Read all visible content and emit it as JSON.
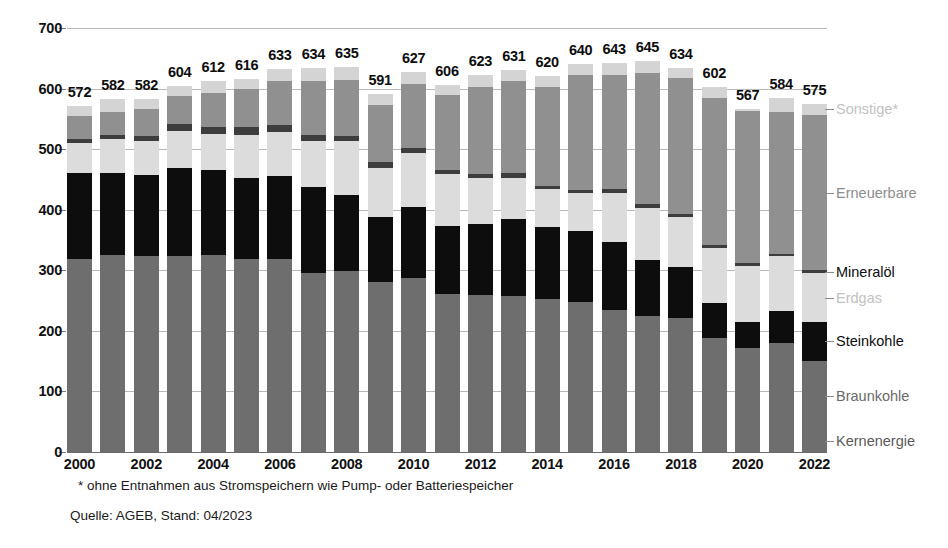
{
  "chart_data": {
    "type": "bar",
    "stacked": true,
    "title": "",
    "subtitle": "",
    "xlabel": "",
    "ylabel": "",
    "ylim": [
      0,
      700
    ],
    "ytick_step": 100,
    "yticks": [
      "0",
      "100",
      "200",
      "300",
      "400",
      "500",
      "600",
      "700"
    ],
    "grid": true,
    "legend_position": "right",
    "categories": [
      "2000",
      "2001",
      "2002",
      "2003",
      "2004",
      "2005",
      "2006",
      "2007",
      "2008",
      "2009",
      "2010",
      "2011",
      "2012",
      "2013",
      "2014",
      "2015",
      "2016",
      "2017",
      "2018",
      "2019",
      "2020",
      "2021",
      "2022"
    ],
    "xtick_labels": [
      "2000",
      "",
      "2002",
      "",
      "2004",
      "",
      "2006",
      "",
      "2008",
      "",
      "2010",
      "",
      "2012",
      "",
      "2014",
      "",
      "2016",
      "",
      "2018",
      "",
      "2020",
      "",
      "2022"
    ],
    "totals": [
      572,
      582,
      582,
      604,
      612,
      616,
      633,
      634,
      635,
      591,
      627,
      606,
      623,
      631,
      620,
      640,
      643,
      645,
      634,
      602,
      567,
      584,
      575
    ],
    "series": [
      {
        "name": "Kernenergie",
        "color": "#6e6e6e",
        "values": [
          170,
          171,
          165,
          165,
          167,
          163,
          167,
          141,
          148,
          135,
          141,
          108,
          99,
          97,
          97,
          92,
          85,
          76,
          76,
          75,
          64,
          69,
          35
        ]
      },
      {
        "name": "Braunkohle",
        "color": "#6e6e6e",
        "values": [
          148,
          155,
          158,
          158,
          158,
          155,
          151,
          155,
          151,
          146,
          146,
          153,
          161,
          161,
          156,
          155,
          150,
          148,
          146,
          114,
          108,
          111,
          116
        ]
      },
      {
        "name": "Steinkohle",
        "color": "#0d0d0d",
        "values": [
          143,
          134,
          134,
          146,
          140,
          134,
          137,
          142,
          125,
          107,
          117,
          112,
          116,
          127,
          119,
          118,
          112,
          93,
          83,
          57,
          43,
          53,
          63
        ]
      },
      {
        "name": "Erdgas",
        "color": "#dcdcdc",
        "values": [
          49,
          56,
          56,
          61,
          60,
          72,
          73,
          76,
          89,
          81,
          89,
          86,
          76,
          68,
          62,
          62,
          81,
          86,
          83,
          91,
          92,
          90,
          81
        ]
      },
      {
        "name": "Mineralöl",
        "color": "#3d3d3d",
        "values": [
          6,
          7,
          9,
          11,
          11,
          12,
          12,
          10,
          9,
          9,
          9,
          7,
          7,
          7,
          6,
          6,
          6,
          6,
          5,
          5,
          5,
          4,
          5
        ]
      },
      {
        "name": "Erneuerbare",
        "color": "#909090",
        "values": [
          38,
          39,
          45,
          46,
          57,
          63,
          72,
          88,
          93,
          95,
          105,
          124,
          144,
          152,
          162,
          189,
          189,
          216,
          225,
          243,
          251,
          234,
          256
        ]
      },
      {
        "name": "Sonstige*",
        "color": "#d4d4d4",
        "values": [
          18,
          20,
          15,
          17,
          19,
          17,
          21,
          22,
          20,
          18,
          20,
          16,
          20,
          19,
          18,
          18,
          20,
          20,
          16,
          17,
          4,
          23,
          19
        ]
      }
    ],
    "legend_entries": [
      {
        "label": "Sonstige*",
        "color": "#d4d4d4"
      },
      {
        "label": "Erneuerbare",
        "color": "#909090"
      },
      {
        "label": "Mineralöl",
        "color": "#3d3d3d"
      },
      {
        "label": "Erdgas",
        "color": "#dcdcdc"
      },
      {
        "label": "Steinkohle",
        "color": "#0d0d0d"
      },
      {
        "label": "Braunkohle",
        "color": "#6e6e6e"
      },
      {
        "label": "Kernenergie",
        "color": "#5f5f5f"
      }
    ],
    "annotations": {
      "footnote": "* ohne Entnahmen aus Stromspeichern wie Pump- oder Batteriespeicher",
      "source": "Quelle: AGEB, Stand: 04/2023"
    }
  }
}
